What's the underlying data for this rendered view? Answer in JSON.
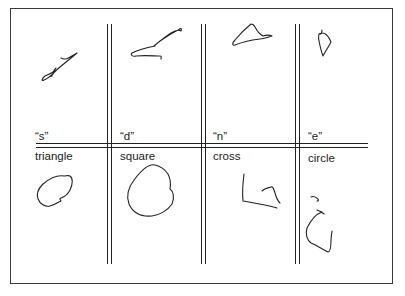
{
  "figure": {
    "columns": [
      {
        "letter": "“s”",
        "shape": "triangle"
      },
      {
        "letter": "“d”",
        "shape": "square"
      },
      {
        "letter": "“n”",
        "shape": "cross"
      },
      {
        "letter": "“e”",
        "shape": "circle"
      }
    ],
    "line_color": "#222222",
    "background": "#ffffff"
  }
}
